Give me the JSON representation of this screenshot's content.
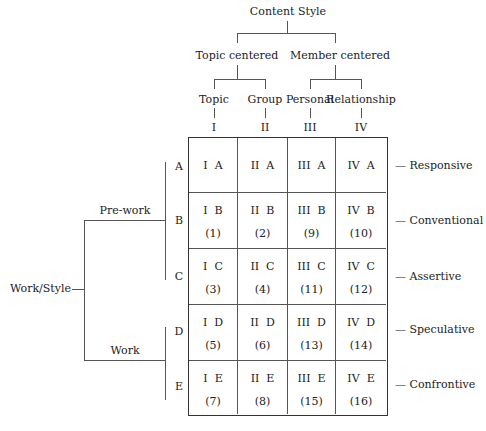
{
  "content_style": {
    "title": "Content Style",
    "groups": [
      {
        "label": "Topic centered",
        "children": [
          "Topic",
          "Group"
        ]
      },
      {
        "label": "Member centered",
        "children": [
          "Personal",
          "Relationship"
        ]
      }
    ],
    "columns": [
      "I",
      "II",
      "III",
      "IV"
    ]
  },
  "work_style": {
    "title": "Work/Style",
    "groups": [
      {
        "label": "Pre-work",
        "rows": [
          "A",
          "B",
          "C"
        ]
      },
      {
        "label": "Work",
        "rows": [
          "D",
          "E"
        ]
      }
    ],
    "rows": [
      "A",
      "B",
      "C",
      "D",
      "E"
    ]
  },
  "right_labels": [
    "Responsive",
    "Conventional",
    "Assertive",
    "Speculative",
    "Confrontive"
  ],
  "grid": [
    [
      {
        "code": "I  A",
        "num": ""
      },
      {
        "code": "II  A",
        "num": ""
      },
      {
        "code": "III  A",
        "num": ""
      },
      {
        "code": "IV  A",
        "num": ""
      }
    ],
    [
      {
        "code": "I  B",
        "num": "(1)"
      },
      {
        "code": "II  B",
        "num": "(2)"
      },
      {
        "code": "III  B",
        "num": "(9)"
      },
      {
        "code": "IV  B",
        "num": "(10)"
      }
    ],
    [
      {
        "code": "I  C",
        "num": "(3)"
      },
      {
        "code": "II  C",
        "num": "(4)"
      },
      {
        "code": "III  C",
        "num": "(11)"
      },
      {
        "code": "IV  C",
        "num": "(12)"
      }
    ],
    [
      {
        "code": "I  D",
        "num": "(5)"
      },
      {
        "code": "II  D",
        "num": "(6)"
      },
      {
        "code": "III  D",
        "num": "(13)"
      },
      {
        "code": "IV  D",
        "num": "(14)"
      }
    ],
    [
      {
        "code": "I  E",
        "num": "(7)"
      },
      {
        "code": "II  E",
        "num": "(8)"
      },
      {
        "code": "III  E",
        "num": "(15)"
      },
      {
        "code": "IV  E",
        "num": "(16)"
      }
    ]
  ]
}
